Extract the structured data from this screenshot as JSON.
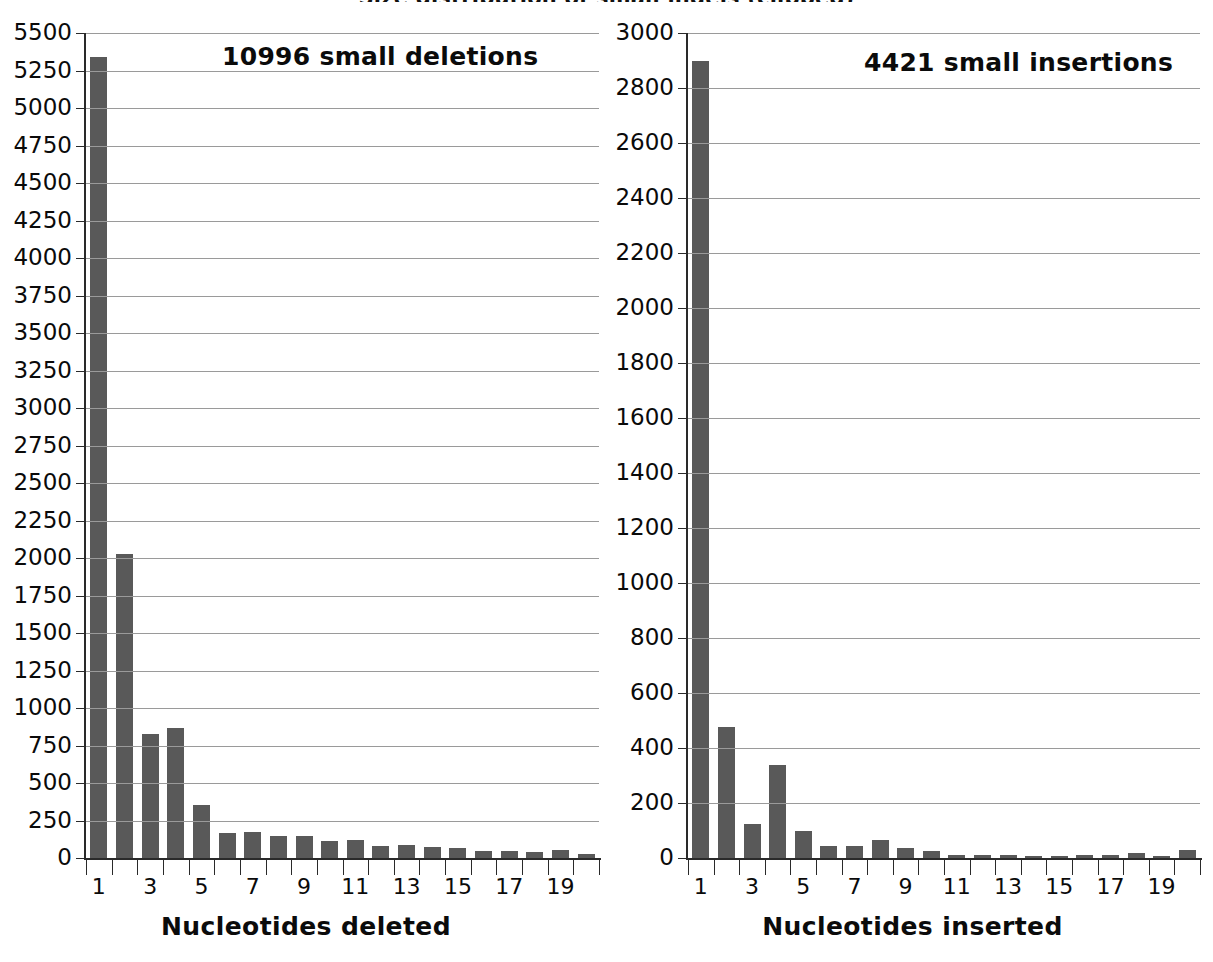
{
  "figure": {
    "title": "Size distribution of small indels (clipped)"
  },
  "chart_data": [
    {
      "type": "bar",
      "panel": "left",
      "title": "10996 small deletions",
      "annotation": "10996 small deletions",
      "xlabel": "Nucleotides deleted",
      "ylabel": "",
      "ylim": [
        0,
        5500
      ],
      "ytick_step": 250,
      "ytick_labels": [
        "0",
        "250",
        "500",
        "750",
        "1000",
        "1250",
        "1500",
        "1750",
        "2000",
        "2250",
        "2500",
        "2750",
        "3000",
        "3250",
        "3500",
        "3750",
        "4000",
        "4250",
        "4500",
        "4750",
        "5000",
        "5250",
        "5500"
      ],
      "grid": true,
      "legend": false,
      "categories": [
        1,
        2,
        3,
        4,
        5,
        6,
        7,
        8,
        9,
        10,
        11,
        12,
        13,
        14,
        15,
        16,
        17,
        18,
        19,
        20
      ],
      "xtick_labels_shown": [
        "1",
        "3",
        "5",
        "7",
        "9",
        "11",
        "13",
        "15",
        "17",
        "19"
      ],
      "values": [
        5340,
        2030,
        830,
        870,
        355,
        165,
        175,
        145,
        145,
        115,
        120,
        80,
        90,
        75,
        70,
        50,
        50,
        40,
        55,
        25
      ],
      "bar_color": "#595959"
    },
    {
      "type": "bar",
      "panel": "right",
      "title": "4421 small insertions",
      "annotation": "4421 small insertions",
      "xlabel": "Nucleotides inserted",
      "ylabel": "",
      "ylim": [
        0,
        3000
      ],
      "ytick_step": 200,
      "ytick_labels": [
        "0",
        "200",
        "400",
        "600",
        "800",
        "1000",
        "1200",
        "1400",
        "1600",
        "1800",
        "2000",
        "2200",
        "2400",
        "2600",
        "2800",
        "3000"
      ],
      "grid": true,
      "legend": false,
      "categories": [
        1,
        2,
        3,
        4,
        5,
        6,
        7,
        8,
        9,
        10,
        11,
        12,
        13,
        14,
        15,
        16,
        17,
        18,
        19,
        20
      ],
      "xtick_labels_shown": [
        "1",
        "3",
        "5",
        "7",
        "9",
        "11",
        "13",
        "15",
        "17",
        "19"
      ],
      "values": [
        2900,
        475,
        125,
        340,
        100,
        45,
        45,
        65,
        35,
        25,
        10,
        12,
        10,
        8,
        8,
        12,
        10,
        20,
        5,
        28
      ],
      "bar_color": "#595959"
    }
  ],
  "style": {
    "background": "#ffffff",
    "axis_color": "#2a2a2a",
    "grid_color": "#9a9a9a",
    "text_color": "#0a0a0a",
    "bar_color": "#595959"
  }
}
